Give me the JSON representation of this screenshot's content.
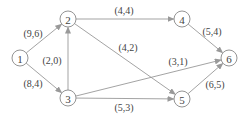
{
  "nodes": [
    {
      "id": "1",
      "x": 20,
      "y": 58
    },
    {
      "id": "2",
      "x": 68,
      "y": 19
    },
    {
      "id": "3",
      "x": 68,
      "y": 98
    },
    {
      "id": "4",
      "x": 182,
      "y": 19
    },
    {
      "id": "5",
      "x": 182,
      "y": 99
    },
    {
      "id": "6",
      "x": 229,
      "y": 58
    }
  ],
  "edges": [
    {
      "from": "1",
      "to": "2",
      "label": "(9,6)",
      "lx": 33,
      "ly": 33
    },
    {
      "from": "1",
      "to": "3",
      "label": "(8,4)",
      "lx": 33,
      "ly": 83
    },
    {
      "from": "3",
      "to": "2",
      "label": "(2,0)",
      "lx": 52,
      "ly": 60
    },
    {
      "from": "2",
      "to": "4",
      "label": "(4,4)",
      "lx": 124,
      "ly": 10
    },
    {
      "from": "2",
      "to": "5",
      "label": "(4,2)",
      "lx": 128,
      "ly": 47
    },
    {
      "from": "3",
      "to": "6",
      "label": "(3,1)",
      "lx": 178,
      "ly": 61
    },
    {
      "from": "3",
      "to": "5",
      "label": "(5,3)",
      "lx": 124,
      "ly": 107
    },
    {
      "from": "4",
      "to": "6",
      "label": "(5,4)",
      "lx": 212,
      "ly": 31
    },
    {
      "from": "5",
      "to": "6",
      "label": "(6,5)",
      "lx": 215,
      "ly": 84
    }
  ],
  "colors": {
    "stroke": "#999999",
    "text": "#444444"
  }
}
